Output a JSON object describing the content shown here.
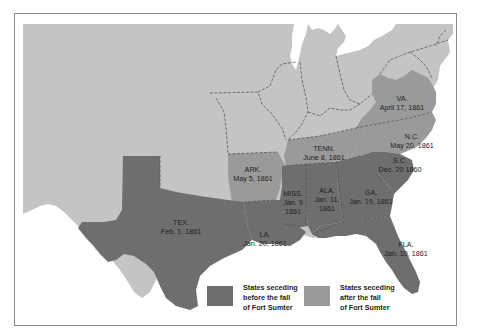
{
  "colors": {
    "background_land": "#c4c4c4",
    "seceded_before": "#6e6e6e",
    "seceded_after": "#9a9a9a",
    "water": "#ffffff",
    "border_line": "#555555",
    "frame": "#8a8a8a",
    "text": "#1e1e1e"
  },
  "states": [
    {
      "abbr": "VA.",
      "date": "April 17, 1861",
      "group": "after"
    },
    {
      "abbr": "N.C.",
      "date": "May 20, 1861",
      "group": "after"
    },
    {
      "abbr": "TENN.",
      "date": "June 8, 1861",
      "group": "after"
    },
    {
      "abbr": "ARK.",
      "date": "May 5, 1861",
      "group": "after"
    },
    {
      "abbr": "S.C.",
      "date": "Dec. 20 1860",
      "group": "before"
    },
    {
      "abbr": "MISS.",
      "date_line1": "Jan. 9",
      "date_line2": "1861",
      "group": "before"
    },
    {
      "abbr": "ALA.",
      "date_line1": "Jan. 11,",
      "date_line2": "1861",
      "group": "before"
    },
    {
      "abbr": "GA.",
      "date": "Jan. 19, 1861",
      "group": "before"
    },
    {
      "abbr": "LA.",
      "date": "Jan. 20, 1861",
      "group": "before"
    },
    {
      "abbr": "TEX.",
      "date": "Feb. 1, 1861",
      "group": "before"
    },
    {
      "abbr": "FLA.",
      "date": "Jan. 10, 1861",
      "group": "before"
    }
  ],
  "legend": {
    "items": [
      {
        "line1": "States seceding",
        "line2": "before the fall",
        "line3": "of Fort Sumter",
        "color": "#6e6e6e"
      },
      {
        "line1": "States seceding",
        "line2": "after the fall",
        "line3": "of Fort Sumter",
        "color": "#9a9a9a"
      }
    ]
  }
}
